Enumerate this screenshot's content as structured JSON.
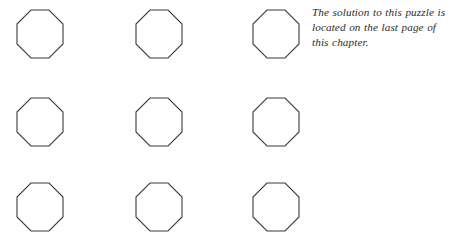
{
  "page": {
    "background_color": "#ffffff",
    "width": 461,
    "height": 249
  },
  "puzzle": {
    "shape_name": "octagon",
    "shape_count": 9,
    "rows": 3,
    "columns": 3,
    "stroke_color": "#3b3b3b",
    "fill_color": "#ffffff",
    "cells": [
      {
        "row": 1,
        "column": 1,
        "label": ""
      },
      {
        "row": 1,
        "column": 2,
        "label": ""
      },
      {
        "row": 1,
        "column": 3,
        "label": ""
      },
      {
        "row": 2,
        "column": 1,
        "label": ""
      },
      {
        "row": 2,
        "column": 2,
        "label": ""
      },
      {
        "row": 2,
        "column": 3,
        "label": ""
      },
      {
        "row": 3,
        "column": 1,
        "label": ""
      },
      {
        "row": 3,
        "column": 2,
        "label": ""
      },
      {
        "row": 3,
        "column": 3,
        "label": ""
      }
    ]
  },
  "caption": {
    "text_color": "#2e2d2b",
    "full_text": "The solution to this puzzle is located on the last page of this chapter.",
    "lines": [
      "The solution to this puzzle is",
      "located on the last page of",
      "this chapter."
    ]
  }
}
